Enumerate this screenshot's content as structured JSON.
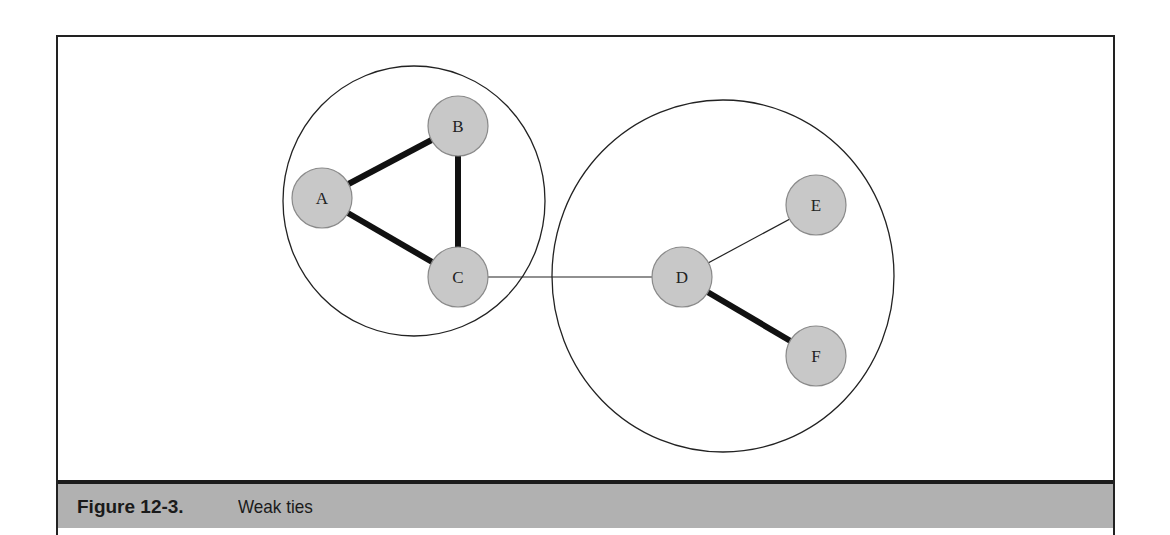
{
  "figure": {
    "number_label": "Figure 12-3.",
    "title": "Weak ties"
  },
  "colors": {
    "node_fill": "#c8c8c8",
    "node_stroke": "#8a8a8a",
    "edge": "#111111",
    "caption_bar": "#b1b1b1"
  },
  "clusters": [
    {
      "id": "cluster-left",
      "cx": 414,
      "cy": 201,
      "rx": 131,
      "ry": 135,
      "members": [
        "A",
        "B",
        "C"
      ]
    },
    {
      "id": "cluster-right",
      "cx": 723,
      "cy": 276,
      "rx": 171,
      "ry": 176,
      "members": [
        "D",
        "E",
        "F"
      ]
    }
  ],
  "nodes": [
    {
      "id": "A",
      "label": "A",
      "cx": 322,
      "cy": 198
    },
    {
      "id": "B",
      "label": "B",
      "cx": 458,
      "cy": 126
    },
    {
      "id": "C",
      "label": "C",
      "cx": 458,
      "cy": 277
    },
    {
      "id": "D",
      "label": "D",
      "cx": 682,
      "cy": 277
    },
    {
      "id": "E",
      "label": "E",
      "cx": 816,
      "cy": 205
    },
    {
      "id": "F",
      "label": "F",
      "cx": 816,
      "cy": 356
    }
  ],
  "edges": [
    {
      "from": "A",
      "to": "B",
      "type": "strong"
    },
    {
      "from": "A",
      "to": "C",
      "type": "strong"
    },
    {
      "from": "B",
      "to": "C",
      "type": "strong"
    },
    {
      "from": "C",
      "to": "D",
      "type": "weak"
    },
    {
      "from": "D",
      "to": "E",
      "type": "weak"
    },
    {
      "from": "D",
      "to": "F",
      "type": "strong"
    }
  ]
}
